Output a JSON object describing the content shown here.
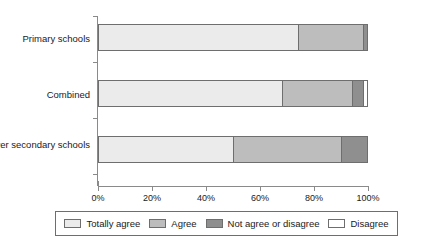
{
  "chart_data": {
    "type": "bar",
    "orientation": "horizontal",
    "stacked": true,
    "normalized_percent": true,
    "title": "",
    "subtitle": "",
    "xlabel": "",
    "ylabel": "",
    "xlim": [
      0,
      100
    ],
    "xticks": [
      0,
      20,
      40,
      60,
      80,
      100
    ],
    "xtick_labels": [
      "0%",
      "20%",
      "40%",
      "60%",
      "80%",
      "100%"
    ],
    "grid": false,
    "legend_position": "bottom",
    "categories": [
      "Primary schools",
      "Combined",
      "Lower secondary schools"
    ],
    "series": [
      {
        "name": "Totally agree",
        "color": "#ebebeb",
        "values": [
          74,
          68,
          50
        ]
      },
      {
        "name": "Agree",
        "color": "#bdbdbd",
        "values": [
          24,
          26,
          40
        ]
      },
      {
        "name": "Not agree or disagree",
        "color": "#8f8f8f",
        "values": [
          2,
          4,
          10
        ]
      },
      {
        "name": "Disagree",
        "color": "#ffffff",
        "values": [
          0,
          2,
          0
        ]
      }
    ]
  },
  "axis": {
    "x_tick_labels": [
      "0%",
      "20%",
      "40%",
      "60%",
      "80%",
      "100%"
    ]
  },
  "categories": [
    {
      "label": "Primary schools"
    },
    {
      "label": "Combined"
    },
    {
      "label": "Lower secondary schools"
    }
  ],
  "legend": {
    "items": [
      {
        "label": "Totally agree",
        "color": "#ebebeb"
      },
      {
        "label": "Agree",
        "color": "#bdbdbd"
      },
      {
        "label": "Not agree or disagree",
        "color": "#8f8f8f"
      },
      {
        "label": "Disagree",
        "color": "#ffffff"
      }
    ]
  }
}
